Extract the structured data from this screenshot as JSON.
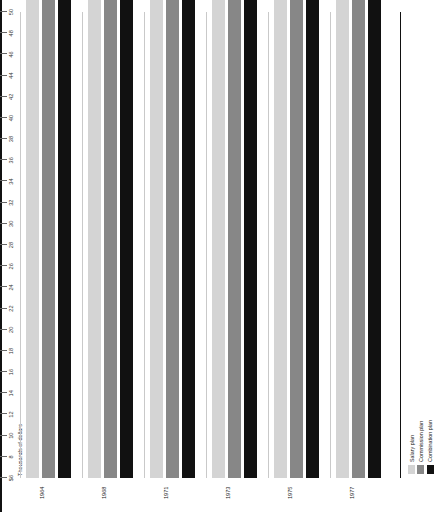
{
  "chart_data": {
    "type": "bar",
    "title": "",
    "xlabel": "Thousands of dollars",
    "ylabel": "",
    "orientation": "horizontal-rotated",
    "axis_title": "Thousands of dollars",
    "axis_ticks": [
      "$6",
      "8",
      "10",
      "12",
      "14",
      "16",
      "18",
      "20",
      "22",
      "24",
      "26",
      "28",
      "30",
      "32",
      "34",
      "36",
      "38",
      "40",
      "42",
      "44",
      "46",
      "48",
      "50"
    ],
    "axis_tick_values": [
      6,
      8,
      10,
      12,
      14,
      16,
      18,
      20,
      22,
      24,
      26,
      28,
      30,
      32,
      34,
      36,
      38,
      40,
      42,
      44,
      46,
      48,
      50
    ],
    "xlim": [
      6,
      50
    ],
    "grid": false,
    "legend_position": "bottom-right",
    "categories": [
      "1964",
      "1968",
      "1971",
      "1973",
      "1975",
      "1977"
    ],
    "series": [
      {
        "name": "Salary plan",
        "color": "#d4d4d4",
        "values": [
          9700,
          10000,
          13100,
          16566,
          18280,
          20950
        ],
        "labels": [
          "$9,700",
          "$10,000",
          "$13,100",
          "$16,566",
          "$18,280",
          "$20,950 (increase over 1975—14.6%)"
        ]
      },
      {
        "name": "Commission plan",
        "color": "#878787",
        "values": [
          10000,
          13250,
          16040,
          20245,
          22530,
          24450
        ],
        "labels": [
          "$10,000",
          "$13,250",
          "$16,040",
          "$20,245",
          "$22,530",
          "$24,450 (increase over 1975—8.6%)"
        ]
      },
      {
        "name": "Combination plan",
        "color": "#111111",
        "values": [
          9900,
          10578,
          14790,
          18297,
          21650,
          26100
        ],
        "labels": [
          "$9,900",
          "$10,578",
          "$14,790",
          "$18,297",
          "$21,650",
          "$26,100 (increase over 1975—20.6%)"
        ]
      }
    ]
  },
  "legend": {
    "items": [
      {
        "label": "Salary plan",
        "color": "#d4d4d4"
      },
      {
        "label": "Commission plan",
        "color": "#878787"
      },
      {
        "label": "Combination plan",
        "color": "#111111"
      }
    ]
  }
}
